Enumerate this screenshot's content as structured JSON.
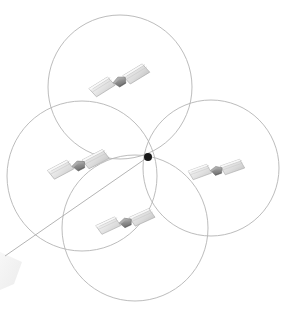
{
  "figure": {
    "background_color": "#ffffff",
    "width": 297,
    "height": 316
  },
  "chart_data": {
    "type": "scatter",
    "xlabel": "",
    "ylabel": "",
    "grid": false,
    "legend": "none",
    "xlim": [
      0,
      297
    ],
    "ylim": [
      0,
      316
    ],
    "common_node": {
      "x": 148,
      "y": 157,
      "radius": 4,
      "color": "#1a1a1a"
    },
    "orbits": [
      {
        "name": "orbit-top",
        "cx": 120,
        "cy": 87,
        "r": 72,
        "stroke": "#b4b4b4"
      },
      {
        "name": "orbit-left",
        "cx": 82,
        "cy": 176,
        "r": 75,
        "stroke": "#b4b4b4"
      },
      {
        "name": "orbit-right",
        "cx": 211,
        "cy": 168,
        "r": 68,
        "stroke": "#b4b4b4"
      },
      {
        "name": "orbit-bottom",
        "cx": 135,
        "cy": 228,
        "r": 73,
        "stroke": "#b4b4b4"
      }
    ],
    "link_line": {
      "x1": 148,
      "y1": 157,
      "x2": 5,
      "y2": 256,
      "stroke": "#aaaaaa"
    },
    "satellites": [
      {
        "name": "satellite-top",
        "x": 119,
        "y": 81,
        "rotation": -16,
        "scale": 1.0
      },
      {
        "name": "satellite-left",
        "x": 78,
        "y": 165,
        "rotation": -12,
        "scale": 1.0
      },
      {
        "name": "satellite-right",
        "x": 216,
        "y": 170,
        "rotation": -4,
        "scale": 0.9
      },
      {
        "name": "satellite-bottom",
        "x": 125,
        "y": 222,
        "rotation": -9,
        "scale": 0.95
      }
    ],
    "ground_wedge": {
      "name": "ground-wedge",
      "points": "0,252 22,262 14,284 0,290",
      "fill": "#f2f2f2"
    },
    "palette": {
      "orbit_stroke": "#b4b4b4",
      "node_fill": "#1a1a1a",
      "panel_light": "#efefef",
      "panel_mid": "#d6d6d6",
      "panel_dark": "#9a9a9a",
      "body_dark": "#7d7d7d",
      "outline": "#9f9f9f"
    }
  }
}
